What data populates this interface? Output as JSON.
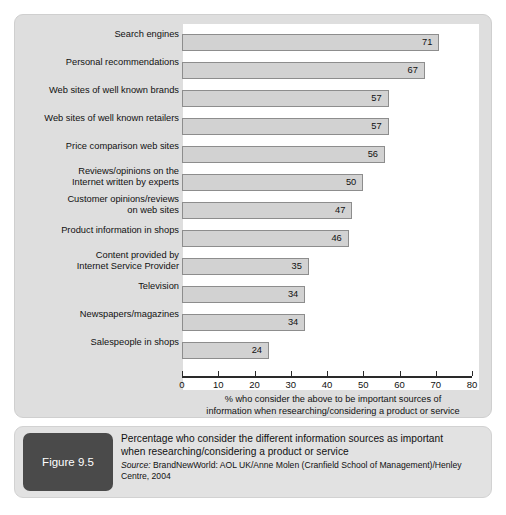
{
  "chart_data": {
    "type": "bar",
    "orientation": "horizontal",
    "title": "",
    "xlabel": "% who consider the above to be important sources of information when researching/considering a product or service",
    "ylabel": "",
    "xlim": [
      0,
      80
    ],
    "xticks": [
      0,
      10,
      20,
      30,
      40,
      50,
      60,
      70,
      80
    ],
    "xtick_labels": [
      "0",
      "10",
      "20",
      "30",
      "40",
      "50",
      "60",
      "70",
      "80"
    ],
    "grid": false,
    "legend": null,
    "categories": [
      "Search engines",
      "Personal recommendations",
      "Web sites of well known brands",
      "Web sites of well known retailers",
      "Price comparison web sites",
      "Reviews/opinions on the\nInternet written by experts",
      "Customer opinions/reviews\non web sites",
      "Product information in shops",
      "Content provided by\nInternet Service Provider",
      "Television",
      "Newspapers/magazines",
      "Salespeople in shops"
    ],
    "values": [
      71,
      67,
      57,
      57,
      56,
      50,
      47,
      46,
      35,
      34,
      34,
      24
    ],
    "value_labels": [
      "71",
      "67",
      "57",
      "57",
      "56",
      "50",
      "47",
      "46",
      "35",
      "34",
      "34",
      "24"
    ],
    "bar_fill_color": "#d2d2d2",
    "bar_border_color": "#8d8d8d"
  },
  "axis": {
    "title_line1": "% who consider the above to be important sources of",
    "title_line2": "information when researching/considering a product or service"
  },
  "caption": {
    "figure_label": "Figure 9.5",
    "title_line1": "Percentage who consider the different information sources as important",
    "title_line2": "when researching/considering a product or service",
    "source_word": "Source:",
    "source_text": " BrandNewWorld: AOL UK/Anne Molen (Cranfield School of Management)/Henley Centre, 2004"
  },
  "colors": {
    "panel_bg": "#dedede",
    "plot_bg": "#ffffff",
    "badge_bg": "#4a4a4a",
    "caption_bg": "#e2e2e2"
  }
}
